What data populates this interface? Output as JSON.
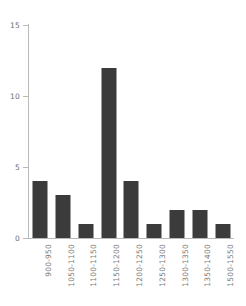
{
  "chart_data": {
    "type": "bar",
    "title": "",
    "subtitle": "",
    "xlabel": "",
    "ylabel": "",
    "categories": [
      "900-950",
      "1050-1100",
      "1100-1150",
      "1150-1200",
      "1200-1250",
      "1250-1300",
      "1300-1350",
      "1350-1400",
      "1500-1550"
    ],
    "values": [
      4,
      3,
      1,
      12,
      4,
      1,
      2,
      2,
      1
    ],
    "ylim": [
      0,
      15
    ],
    "y_ticks": [
      0,
      5,
      10,
      15
    ],
    "y_tick_labels": [
      "0",
      "5",
      "10",
      "15"
    ],
    "grid": false,
    "legend": null,
    "legend_position": "none",
    "bar_color": "#3b3b3b",
    "axis_color": "#b9b9b9",
    "tick_label_color": "#6e6e6e",
    "x_tick_label_color": "#7a7a7a",
    "background_color": "#ffffff",
    "x_tick_rotation_degrees": 90,
    "annotations": []
  }
}
